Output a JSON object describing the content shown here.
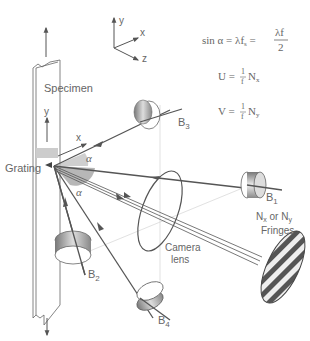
{
  "diagram": {
    "type": "moire-interferometry-setup",
    "axes": {
      "x": "x",
      "y": "y",
      "z": "z"
    },
    "labels": {
      "specimen": "Specimen",
      "grating": "Grating",
      "camera_lens_line1": "Camera",
      "camera_lens_line2": "lens",
      "fringes_line1_a": "N",
      "fringes_line1_a_sub": "x",
      "fringes_line1_or": "or N",
      "fringes_line1_b_sub": "y",
      "fringes_line2": "Fringes",
      "specimen_y": "y",
      "specimen_x": "x",
      "alpha_top": "α",
      "alpha_bottom": "α"
    },
    "beams": [
      {
        "id": "B1",
        "label": "B",
        "sub": "1"
      },
      {
        "id": "B2",
        "label": "B",
        "sub": "2"
      },
      {
        "id": "B3",
        "label": "B",
        "sub": "3"
      },
      {
        "id": "B4",
        "label": "B",
        "sub": "4"
      }
    ],
    "equations": {
      "eq1_lhs": "sin α",
      "eq1_mid": "= λf",
      "eq1_mid_sub": "s",
      "eq1_eq": "=",
      "eq1_num": "λf",
      "eq1_den": "2",
      "eq2_lhs": "U =",
      "eq2_num": "1",
      "eq2_den": "f",
      "eq2_rhs": "N",
      "eq2_sub": "x",
      "eq3_lhs": "V =",
      "eq3_num": "1",
      "eq3_den": "f",
      "eq3_rhs": "N",
      "eq3_sub": "y"
    },
    "colors": {
      "line": "#555555",
      "light_line": "#bbbbbb",
      "text": "#666666"
    }
  }
}
